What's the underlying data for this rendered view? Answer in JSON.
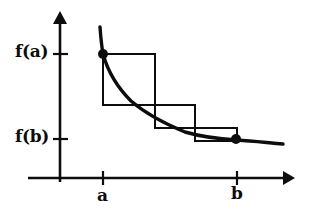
{
  "figure": {
    "background_color": "#ffffff",
    "stroke_color": "#0d0d0d",
    "labels": {
      "y_upper": "f(a)",
      "y_lower": "f(b)",
      "x_left": "a",
      "x_right": "b"
    },
    "icons": {
      "y_axis_arrow": "arrow-up-icon",
      "x_axis_arrow": "arrow-right-icon",
      "point_a": "filled-dot-icon",
      "point_b": "filled-dot-icon"
    }
  },
  "chart_data": {
    "type": "line",
    "xlabel": "",
    "ylabel": "",
    "grid": false,
    "legend": null,
    "axes": {
      "origin_px": [
        60,
        178
      ],
      "y_axis_top_px": 12,
      "x_axis_right_px": 290,
      "x_ticks": [
        {
          "label": "a",
          "x_px": 103
        },
        {
          "label": "b",
          "x_px": 237
        }
      ],
      "y_ticks": [
        {
          "label": "f(a)",
          "y_px": 54
        },
        {
          "label": "f(b)",
          "y_px": 139
        }
      ]
    },
    "series": [
      {
        "name": "f(x)",
        "type": "curve",
        "comment": "convex decreasing curve, pixel coordinates",
        "points_px": [
          [
            100,
            27
          ],
          [
            101,
            40
          ],
          [
            103,
            54
          ],
          [
            107,
            66
          ],
          [
            113,
            78
          ],
          [
            121,
            90
          ],
          [
            131,
            101
          ],
          [
            143,
            111
          ],
          [
            156,
            119
          ],
          [
            170,
            126
          ],
          [
            185,
            132
          ],
          [
            200,
            135
          ],
          [
            215,
            137
          ],
          [
            228,
            138
          ],
          [
            237,
            139
          ],
          [
            250,
            141
          ],
          [
            262,
            142
          ],
          [
            272,
            143
          ],
          [
            283,
            144
          ]
        ]
      }
    ],
    "rectangles": [
      {
        "index": 1,
        "x0_px": 103,
        "x1_px": 155,
        "y_top_px": 54,
        "y_bottom_px": 105
      },
      {
        "index": 2,
        "x0_px": 155,
        "x1_px": 195,
        "y_top_px": 105,
        "y_bottom_px": 128
      },
      {
        "index": 3,
        "x0_px": 195,
        "x1_px": 237,
        "y_top_px": 128,
        "y_bottom_px": 141
      }
    ],
    "markers": [
      {
        "name": "point-a",
        "label": "(a, f(a))",
        "x_px": 103,
        "y_px": 54,
        "radius_px": 5
      },
      {
        "name": "point-b",
        "label": "(b, f(b))",
        "x_px": 236,
        "y_px": 139,
        "radius_px": 5
      }
    ]
  }
}
